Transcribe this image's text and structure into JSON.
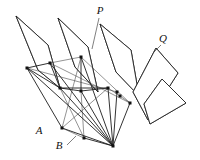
{
  "figure": {
    "background_color": "#ffffff",
    "line_color": "#1c1c1c",
    "stipple_color": "#555555",
    "vertex_color": "#111111",
    "width": 200,
    "height": 160
  },
  "labels": [
    {
      "id": "P",
      "text": "P",
      "x": 100,
      "y": 14,
      "leader": {
        "x1": 99,
        "y1": 18,
        "x2": 92,
        "y2": 49
      }
    },
    {
      "id": "Q",
      "text": "Q",
      "x": 163,
      "y": 42,
      "leader": {
        "x1": 161,
        "y1": 45,
        "x2": 154,
        "y2": 52
      }
    },
    {
      "id": "A",
      "text": "A",
      "x": 39,
      "y": 134,
      "leader": null
    },
    {
      "id": "B",
      "text": "B",
      "x": 59,
      "y": 149,
      "leader": {
        "x1": 67,
        "y1": 145,
        "x2": 76,
        "y2": 136
      }
    }
  ],
  "apex": {
    "x": 113,
    "y": 146
  },
  "planes": [
    {
      "name": "plane-1-left",
      "points": "16,16 48,45 60,88 38,70",
      "stipple_density": 70
    },
    {
      "name": "plane-2-center-left",
      "points": "58,18 88,47 98,92 75,67",
      "stipple_density": 80
    },
    {
      "name": "plane-3-center-right-P",
      "points": "100,24 131,50 139,96 116,72",
      "stipple_density": 80
    },
    {
      "name": "plane-4-right-Q",
      "points": "156,48 178,73 148,120 133,92",
      "stipple_density": 95
    },
    {
      "name": "plane-5-far-right",
      "points": "162,79 186,103 150,124 144,104",
      "stipple_density": 60
    }
  ],
  "vertices": [
    {
      "name": "v-upper-left",
      "x": 27,
      "y": 68
    },
    {
      "name": "v-upper-mid-left",
      "x": 50,
      "y": 63
    },
    {
      "name": "v-mid-left",
      "x": 60,
      "y": 88
    },
    {
      "name": "v-top-center",
      "x": 81,
      "y": 57
    },
    {
      "name": "v-mid-center",
      "x": 81,
      "y": 91
    },
    {
      "name": "v-mid-right",
      "x": 108,
      "y": 88
    },
    {
      "name": "v-right-upper",
      "x": 117,
      "y": 92
    },
    {
      "name": "v-right-lower",
      "x": 120,
      "y": 96
    },
    {
      "name": "v-far-right",
      "x": 130,
      "y": 103
    },
    {
      "name": "v-lower-left",
      "x": 62,
      "y": 128
    },
    {
      "name": "v-lower-mid",
      "x": 84,
      "y": 138
    },
    {
      "name": "v-apex",
      "x": 113,
      "y": 146
    }
  ],
  "segments": [
    {
      "from": "v-upper-left",
      "to": "v-upper-mid-left",
      "weight": "thick"
    },
    {
      "from": "v-upper-left",
      "to": "v-mid-left",
      "weight": "thick"
    },
    {
      "from": "v-upper-left",
      "to": "v-lower-left",
      "weight": "thick"
    },
    {
      "from": "v-upper-left",
      "to": "v-apex",
      "weight": "thick"
    },
    {
      "from": "v-upper-mid-left",
      "to": "v-top-center",
      "weight": "thin"
    },
    {
      "from": "v-upper-mid-left",
      "to": "v-mid-left",
      "weight": "thick"
    },
    {
      "from": "v-upper-mid-left",
      "to": "v-apex",
      "weight": "thick"
    },
    {
      "from": "v-mid-left",
      "to": "v-mid-center",
      "weight": "thick"
    },
    {
      "from": "v-mid-left",
      "to": "v-mid-right",
      "weight": "thick"
    },
    {
      "from": "v-mid-left",
      "to": "v-apex",
      "weight": "thick"
    },
    {
      "from": "v-top-center",
      "to": "v-mid-center",
      "weight": "thick"
    },
    {
      "from": "v-top-center",
      "to": "v-apex",
      "weight": "thick"
    },
    {
      "from": "v-top-center",
      "to": "v-lower-left",
      "weight": "thin"
    },
    {
      "from": "v-top-center",
      "to": "v-far-right",
      "weight": "thin"
    },
    {
      "from": "v-mid-center",
      "to": "v-mid-right",
      "weight": "thick"
    },
    {
      "from": "v-mid-center",
      "to": "v-apex",
      "weight": "thick"
    },
    {
      "from": "v-mid-center",
      "to": "v-lower-mid",
      "weight": "thin"
    },
    {
      "from": "v-mid-right",
      "to": "v-apex",
      "weight": "thick"
    },
    {
      "from": "v-mid-right",
      "to": "v-right-lower",
      "weight": "thin"
    },
    {
      "from": "v-right-upper",
      "to": "v-apex",
      "weight": "thick"
    },
    {
      "from": "v-right-lower",
      "to": "v-far-right",
      "weight": "thin"
    },
    {
      "from": "v-far-right",
      "to": "v-apex",
      "weight": "thick"
    },
    {
      "from": "v-lower-left",
      "to": "v-apex",
      "weight": "thick"
    },
    {
      "from": "v-lower-left",
      "to": "v-lower-mid",
      "weight": "thin"
    },
    {
      "from": "v-lower-mid",
      "to": "v-apex",
      "weight": "thick"
    },
    {
      "from": "v-upper-left",
      "to": "v-right-upper",
      "weight": "thin"
    },
    {
      "from": "v-upper-mid-left",
      "to": "v-far-right",
      "weight": "thin"
    },
    {
      "from": "v-mid-left",
      "to": "v-lower-mid",
      "weight": "thin"
    },
    {
      "from": "v-lower-left",
      "to": "v-mid-right",
      "weight": "thin"
    }
  ]
}
